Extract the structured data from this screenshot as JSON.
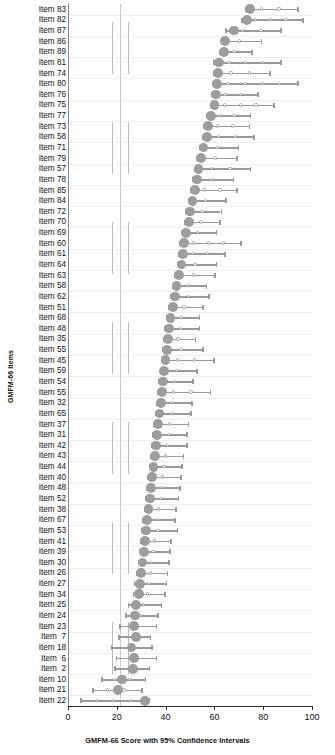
{
  "chart_data": {
    "type": "scatter",
    "title": "",
    "xlabel": "GMFM-66 Score with 95% Confidence Intervals",
    "ylabel": "GMFM-66 Items",
    "xlim": [
      0,
      100
    ],
    "ylim_label": "items ordered by difficulty",
    "xticks": [
      0,
      20,
      40,
      60,
      80,
      100
    ],
    "xticklabels": [
      "0",
      "20",
      "40",
      "60",
      "80",
      "100"
    ],
    "grid": "horizontal",
    "legend": "none",
    "marker": "filled-circle-estimate-with-95%-CI-whiskers",
    "categories": [
      "Item 83",
      "Item 82",
      "Item 87",
      "Item 86",
      "Item 89",
      "Item 81",
      "Item 74",
      "Item 80",
      "Item 76",
      "Item 75",
      "Item 77",
      "Item 73",
      "Item 58",
      "Item 71",
      "Item 79",
      "Item 57",
      "Item 78",
      "Item 85",
      "Item 84",
      "Item 72",
      "Item 70",
      "Item 69",
      "Item 60",
      "Item 61",
      "Item 64",
      "Item 63",
      "Item 58",
      "Item 62",
      "Item 51",
      "Item 68",
      "Item 48",
      "Item 35",
      "Item 55",
      "Item 45",
      "Item 59",
      "Item 54",
      "Item 55",
      "Item 32",
      "Item 65",
      "Item 37",
      "Item 31",
      "Item 42",
      "Item 43",
      "Item 44",
      "Item 40",
      "Item 48",
      "Item 52",
      "Item 38",
      "Item 67",
      "Item 53",
      "Item 41",
      "Item 39",
      "Item 30",
      "Item 26",
      "Item 27",
      "Item 34",
      "Item 25",
      "Item 24",
      "Item 23",
      "Item  7",
      "Item 18",
      "Item  6",
      "Item  2",
      "Item 10",
      "Item 21",
      "Item 22"
    ],
    "values": [
      74.5,
      73.5,
      68.0,
      64.5,
      64.0,
      62.0,
      61.5,
      61.0,
      60.5,
      60.0,
      58.5,
      57.5,
      57.0,
      55.5,
      54.5,
      53.5,
      53.0,
      52.0,
      51.0,
      50.0,
      49.5,
      48.5,
      47.5,
      47.0,
      46.5,
      45.5,
      44.5,
      44.0,
      43.0,
      42.0,
      41.5,
      41.0,
      40.5,
      40.0,
      39.5,
      39.0,
      38.5,
      38.0,
      37.5,
      37.0,
      36.5,
      36.0,
      35.5,
      35.0,
      34.5,
      34.0,
      33.5,
      33.0,
      32.5,
      32.0,
      31.5,
      31.0,
      30.5,
      30.0,
      29.5,
      29.0,
      28.0,
      27.5,
      27.0,
      28.0,
      26.0,
      27.0,
      26.5,
      22.0,
      20.5,
      31.5
    ],
    "ci_low": [
      72.5,
      71.0,
      64.5,
      62.5,
      62.0,
      59.5,
      59.5,
      59.0,
      58.5,
      58.0,
      56.5,
      55.5,
      55.0,
      53.5,
      52.5,
      51.5,
      51.0,
      50.0,
      49.0,
      48.0,
      47.5,
      46.5,
      45.5,
      45.0,
      44.5,
      43.5,
      42.5,
      42.0,
      41.0,
      40.0,
      39.5,
      39.0,
      38.5,
      38.0,
      37.5,
      37.0,
      36.5,
      36.0,
      35.5,
      35.0,
      34.5,
      34.0,
      33.5,
      33.0,
      32.5,
      32.0,
      31.5,
      31.0,
      30.5,
      30.0,
      29.5,
      29.0,
      28.5,
      28.0,
      27.0,
      26.5,
      24.5,
      23.5,
      21.0,
      20.5,
      17.5,
      19.5,
      19.0,
      13.5,
      10.0,
      5.0
    ],
    "ci_high": [
      94.0,
      96.0,
      87.0,
      79.0,
      75.0,
      87.0,
      82.5,
      94.0,
      77.5,
      84.0,
      74.5,
      74.0,
      76.0,
      69.5,
      69.0,
      74.5,
      67.5,
      69.0,
      64.5,
      62.5,
      62.0,
      60.5,
      70.5,
      64.0,
      60.5,
      60.0,
      56.5,
      57.5,
      55.0,
      53.5,
      53.5,
      52.0,
      55.0,
      59.5,
      52.5,
      51.0,
      58.0,
      50.5,
      50.0,
      49.0,
      48.5,
      48.5,
      47.0,
      46.5,
      46.0,
      45.5,
      45.0,
      44.0,
      43.5,
      44.5,
      42.0,
      41.5,
      41.0,
      40.5,
      40.0,
      39.5,
      38.0,
      36.5,
      36.0,
      33.5,
      34.0,
      36.0,
      33.0,
      31.5,
      30.0,
      33.0
    ],
    "reference_lines": {
      "solid": [
        21.5
      ],
      "dashed": [
        18.0,
        24.5
      ]
    }
  }
}
